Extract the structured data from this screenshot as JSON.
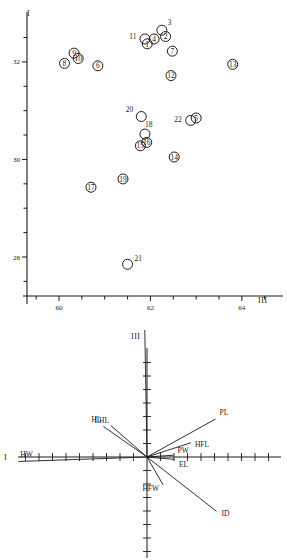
{
  "figure": {
    "panels": [
      "scatter-plot",
      "vector-plot"
    ]
  },
  "chart_data": [
    {
      "type": "scatter",
      "title": "",
      "xlabel": "III",
      "ylabel": "I",
      "xlim": [
        59.3,
        64.9
      ],
      "ylim": [
        27.2,
        32.9
      ],
      "xticks": [
        60,
        62,
        64
      ],
      "xtick_labels": [
        "60",
        "62",
        "64"
      ],
      "yticks": [
        28,
        30,
        32
      ],
      "ytick_labels": [
        "28",
        "30",
        "32"
      ],
      "grid": false,
      "legend": "none",
      "marker": "open-circle",
      "points": [
        {
          "label": "1",
          "inside": true,
          "x": 61.93,
          "y": 32.37
        },
        {
          "label": "2",
          "inside": true,
          "x": 62.33,
          "y": 32.52
        },
        {
          "label": "3",
          "inside": false,
          "x": 62.25,
          "y": 32.65
        },
        {
          "label": "4",
          "inside": true,
          "x": 62.08,
          "y": 32.47
        },
        {
          "label": "5",
          "inside": true,
          "x": 63.0,
          "y": 30.85
        },
        {
          "label": "6",
          "inside": true,
          "x": 60.85,
          "y": 31.92
        },
        {
          "label": "7",
          "inside": true,
          "x": 62.48,
          "y": 32.22
        },
        {
          "label": "8",
          "inside": true,
          "x": 60.12,
          "y": 31.97
        },
        {
          "label": "9",
          "inside": true,
          "x": 60.33,
          "y": 32.18
        },
        {
          "label": "10",
          "inside": true,
          "x": 60.42,
          "y": 32.07
        },
        {
          "label": "11",
          "inside": false,
          "x": 61.88,
          "y": 32.47
        },
        {
          "label": "12",
          "inside": true,
          "x": 62.45,
          "y": 31.72
        },
        {
          "label": "13",
          "inside": true,
          "x": 63.8,
          "y": 31.95
        },
        {
          "label": "14",
          "inside": true,
          "x": 62.52,
          "y": 30.05
        },
        {
          "label": "15",
          "inside": true,
          "x": 61.78,
          "y": 30.28
        },
        {
          "label": "16",
          "inside": true,
          "x": 61.92,
          "y": 30.35
        },
        {
          "label": "17",
          "inside": true,
          "x": 60.7,
          "y": 29.43
        },
        {
          "label": "18",
          "inside": false,
          "x": 61.88,
          "y": 30.52
        },
        {
          "label": "19",
          "inside": true,
          "x": 61.4,
          "y": 29.6
        },
        {
          "label": "20",
          "inside": false,
          "x": 61.8,
          "y": 30.88
        },
        {
          "label": "21",
          "inside": false,
          "x": 61.5,
          "y": 27.85
        },
        {
          "label": "22",
          "inside": false,
          "x": 62.88,
          "y": 30.8
        }
      ]
    },
    {
      "type": "vector",
      "title": "",
      "xlabel": "I",
      "ylabel": "III",
      "origin": [
        0,
        0
      ],
      "vectors": [
        {
          "name": "rFL",
          "angle_deg": 91,
          "length": 0.97
        },
        {
          "name": "PL",
          "angle_deg": 29,
          "length": 0.56
        },
        {
          "name": "HFL",
          "angle_deg": 18,
          "length": 0.33
        },
        {
          "name": "PW",
          "angle_deg": 4,
          "length": 0.19
        },
        {
          "name": "EL",
          "angle_deg": -5,
          "length": 0.2
        },
        {
          "name": "HW",
          "angle_deg": 182,
          "length": 0.92
        },
        {
          "name": "HL",
          "angle_deg": 145,
          "length": 0.38
        },
        {
          "name": "LHL",
          "angle_deg": 139,
          "length": 0.34
        },
        {
          "name": "HFW",
          "angle_deg": -60,
          "length": 0.23
        },
        {
          "name": "ID",
          "angle_deg": -38,
          "length": 0.63
        }
      ]
    }
  ]
}
